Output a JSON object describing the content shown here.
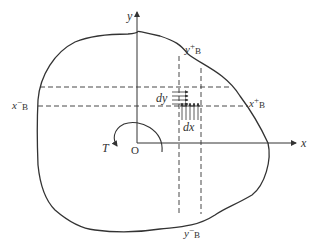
{
  "diagram": {
    "colors": {
      "stroke": "#333333",
      "background": "#ffffff"
    },
    "axes": {
      "x_label": "x",
      "y_label": "y",
      "origin_label": "O"
    },
    "torque": {
      "label": "T"
    },
    "element": {
      "dy_label": "dy",
      "dx_label": "dx"
    },
    "boundary_points": {
      "x_minus": {
        "main": "x",
        "sup": "−",
        "sub": "B"
      },
      "x_plus": {
        "main": "x",
        "sup": "+",
        "sub": "B"
      },
      "y_minus": {
        "main": "y",
        "sup": "−",
        "sub": "B"
      },
      "y_plus": {
        "main": "y",
        "sup": "+",
        "sub": "B"
      }
    }
  }
}
